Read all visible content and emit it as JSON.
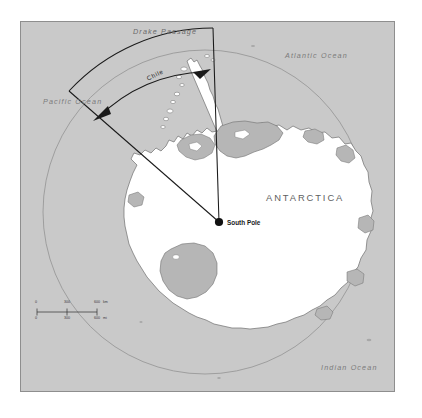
{
  "figure": {
    "projection": "south polar azimuthal",
    "background_color": "#ffffff",
    "ocean_color": "#c9c9c9",
    "land_color": "#ffffff",
    "ice_shelf_color": "#b6b6b6",
    "frame_border_color": "#8e8e8e",
    "line_color": "#1a1a1a"
  },
  "labels": {
    "antarctica": "ANTARCTICA",
    "south_pole": "South Pole",
    "chile": "Chile",
    "drake_passage": "Drake Passage",
    "pacific_ocean": "Pacific Ocean",
    "atlantic_ocean": "Atlantic Ocean",
    "indian_ocean": "Indian Ocean"
  },
  "scale_bar": {
    "km": {
      "unit": "km",
      "ticks": [
        "0",
        "300",
        "600"
      ]
    },
    "mi": {
      "unit": "mi",
      "ticks": [
        "0",
        "300",
        "600"
      ]
    }
  },
  "annotations": {
    "sector_description": "Wedge radiating from South Pole delimiting the claimed sector",
    "arrow_style": "double-headed arc arrow spanning the sector"
  }
}
